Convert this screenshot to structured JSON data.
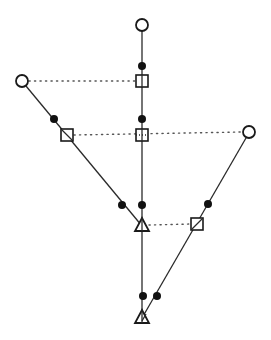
{
  "diagram": {
    "type": "node-link tree / lineage diagram",
    "colors": {
      "line": "#2a2a2a",
      "node_stroke": "#1a1a1a",
      "filled_dot": "#111111",
      "background": "#ffffff"
    },
    "branches": [
      {
        "id": "center",
        "from": [
          142,
          25
        ],
        "to": [
          142,
          318
        ]
      },
      {
        "id": "left",
        "from": [
          22,
          81
        ],
        "to": [
          142,
          226
        ]
      },
      {
        "id": "right",
        "from": [
          249,
          132
        ],
        "to": [
          142,
          318
        ]
      }
    ],
    "dotted_links": [
      {
        "id": "link-top",
        "from": [
          22,
          81
        ],
        "to": [
          142,
          81
        ]
      },
      {
        "id": "link-middle",
        "from": [
          67,
          135
        ],
        "to": [
          249,
          132
        ]
      },
      {
        "id": "link-lower",
        "from": [
          142,
          226
        ],
        "to": [
          197,
          224
        ]
      }
    ],
    "nodes": [
      {
        "id": "open-circle-top",
        "shape": "open-circle",
        "x": 142,
        "y": 25
      },
      {
        "id": "dot-center-1",
        "shape": "filled-dot",
        "x": 142,
        "y": 66
      },
      {
        "id": "square-center-1",
        "shape": "square",
        "x": 142,
        "y": 81
      },
      {
        "id": "open-circle-left",
        "shape": "open-circle",
        "x": 22,
        "y": 81
      },
      {
        "id": "dot-left-1",
        "shape": "filled-dot",
        "x": 54,
        "y": 119
      },
      {
        "id": "square-left",
        "shape": "square",
        "x": 67,
        "y": 135
      },
      {
        "id": "dot-center-2",
        "shape": "filled-dot",
        "x": 142,
        "y": 119
      },
      {
        "id": "square-center-2",
        "shape": "square",
        "x": 142,
        "y": 135
      },
      {
        "id": "open-circle-right",
        "shape": "open-circle",
        "x": 249,
        "y": 132
      },
      {
        "id": "dot-left-2",
        "shape": "filled-dot",
        "x": 122,
        "y": 205
      },
      {
        "id": "dot-center-3",
        "shape": "filled-dot",
        "x": 142,
        "y": 205
      },
      {
        "id": "dot-right-1",
        "shape": "filled-dot",
        "x": 208,
        "y": 204
      },
      {
        "id": "triangle-upper",
        "shape": "triangle",
        "x": 142,
        "y": 226
      },
      {
        "id": "square-right",
        "shape": "square",
        "x": 197,
        "y": 224
      },
      {
        "id": "dot-center-4",
        "shape": "filled-dot",
        "x": 143,
        "y": 296
      },
      {
        "id": "dot-right-2",
        "shape": "filled-dot",
        "x": 157,
        "y": 296
      },
      {
        "id": "triangle-bottom",
        "shape": "triangle",
        "x": 142,
        "y": 318
      }
    ]
  }
}
